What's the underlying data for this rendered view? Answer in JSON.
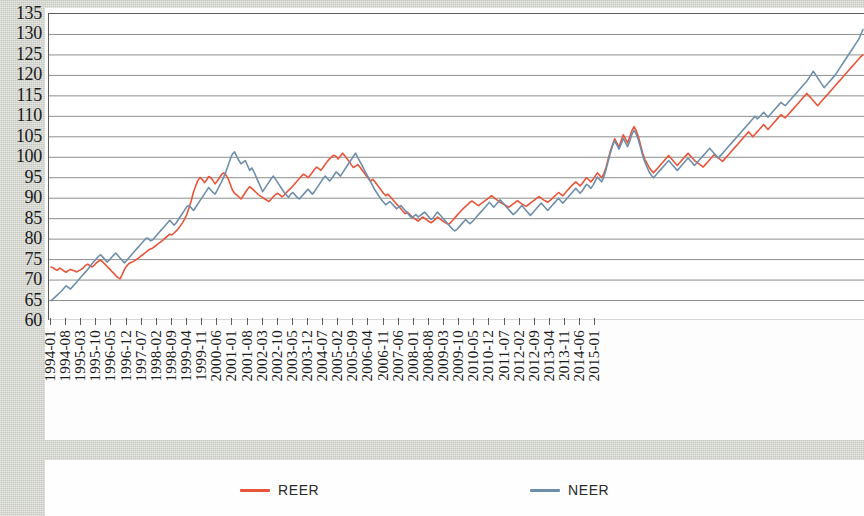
{
  "chart_data": {
    "type": "line",
    "title": "",
    "xlabel": "",
    "ylabel": "",
    "ylim": [
      60,
      135
    ],
    "ytick_step": 5,
    "yticks": [
      135,
      130,
      125,
      120,
      115,
      110,
      105,
      100,
      95,
      90,
      85,
      80,
      75,
      70,
      65,
      60
    ],
    "grid": true,
    "legend_position": "bottom",
    "x_tick_interval_months": 7,
    "x_start": "1994-01",
    "x_end": "2015-01",
    "tick_labels": [
      "1994-01",
      "1994-08",
      "1995-03",
      "1995-10",
      "1996-05",
      "1996-12",
      "1997-07",
      "1998-02",
      "1998-09",
      "1999-04",
      "1999-11",
      "2000-06",
      "2001-01",
      "2001-08",
      "2002-03",
      "2002-10",
      "2003-05",
      "2003-12",
      "2004-07",
      "2005-02",
      "2005-09",
      "2006-04",
      "2006-11",
      "2007-06",
      "2008-01",
      "2008-08",
      "2009-03",
      "2009-10",
      "2010-05",
      "2010-12",
      "2011-07",
      "2012-02",
      "2012-09",
      "2013-04",
      "2013-11",
      "2014-06",
      "2015-01"
    ],
    "colors": {
      "REER": "#e8553a",
      "NEER": "#6e8fab"
    },
    "series": [
      {
        "name": "REER",
        "color": "#e8553a",
        "values": [
          73.2,
          73.0,
          72.6,
          72.4,
          72.9,
          72.6,
          72.2,
          71.9,
          72.3,
          72.6,
          72.4,
          72.2,
          72.0,
          72.3,
          72.6,
          73.0,
          73.6,
          73.9,
          73.5,
          73.2,
          73.6,
          74.2,
          74.6,
          74.9,
          74.4,
          73.9,
          73.3,
          72.8,
          72.2,
          71.7,
          71.1,
          70.6,
          70.3,
          71.4,
          72.6,
          73.4,
          74.0,
          74.3,
          74.5,
          74.8,
          75.2,
          75.6,
          76.0,
          76.4,
          76.8,
          77.3,
          77.6,
          77.8,
          78.2,
          78.6,
          79.0,
          79.4,
          79.8,
          80.3,
          80.8,
          81.2,
          81.0,
          81.5,
          82.0,
          82.6,
          83.3,
          84.1,
          85.0,
          86.2,
          87.8,
          89.5,
          91.5,
          93.0,
          94.3,
          95.1,
          94.6,
          93.8,
          94.4,
          95.3,
          95.0,
          94.3,
          93.5,
          94.2,
          95.0,
          95.8,
          96.2,
          95.7,
          94.8,
          93.4,
          92.0,
          91.2,
          90.8,
          90.3,
          89.8,
          90.6,
          91.4,
          92.2,
          92.8,
          92.4,
          91.9,
          91.4,
          90.9,
          90.5,
          90.2,
          89.8,
          89.5,
          89.2,
          89.8,
          90.4,
          90.9,
          91.2,
          90.8,
          90.3,
          90.8,
          91.4,
          91.9,
          92.4,
          93.0,
          93.6,
          94.2,
          94.8,
          95.4,
          95.9,
          95.5,
          95.0,
          95.6,
          96.3,
          97.0,
          97.6,
          97.2,
          96.8,
          97.5,
          98.3,
          99.0,
          99.6,
          100.1,
          100.5,
          100.2,
          99.6,
          100.3,
          101.0,
          100.4,
          99.7,
          99.0,
          98.2,
          97.5,
          97.8,
          98.2,
          97.6,
          96.9,
          96.2,
          95.5,
          94.8,
          94.2,
          94.6,
          94.0,
          93.3,
          92.6,
          91.9,
          91.2,
          90.6,
          91.0,
          90.4,
          89.8,
          89.2,
          88.6,
          88.0,
          87.4,
          86.8,
          86.2,
          86.6,
          86.1,
          85.6,
          85.1,
          84.8,
          84.4,
          84.9,
          85.4,
          85.1,
          84.7,
          84.3,
          84.0,
          84.4,
          84.9,
          85.4,
          85.0,
          84.6,
          84.2,
          83.9,
          83.6,
          84.0,
          84.6,
          85.2,
          85.8,
          86.4,
          87.0,
          87.5,
          88.0,
          88.5,
          89.0,
          89.3,
          88.9,
          88.5,
          88.2,
          88.6,
          89.0,
          89.4,
          89.8,
          90.2,
          90.6,
          90.2,
          89.8,
          89.4,
          89.0,
          88.7,
          88.4,
          88.1,
          87.8,
          88.2,
          88.6,
          89.0,
          89.4,
          89.0,
          88.6,
          88.3,
          88.0,
          88.4,
          88.8,
          89.2,
          89.6,
          90.0,
          90.4,
          90.0,
          89.6,
          89.3,
          89.0,
          89.4,
          89.9,
          90.4,
          90.9,
          91.4,
          91.0,
          90.6,
          91.2,
          91.8,
          92.4,
          93.0,
          93.5,
          94.0,
          93.5,
          93.0,
          93.6,
          94.3,
          95.0,
          94.5,
          94.0,
          94.6,
          95.4,
          96.2,
          95.6,
          95.0,
          96.0,
          97.5,
          99.5,
          101.5,
          103.0,
          104.5,
          103.5,
          102.5,
          104.0,
          105.5,
          104.5,
          103.5,
          105.0,
          106.5,
          107.5,
          106.5,
          105.0,
          103.0,
          101.0,
          99.5,
          98.5,
          97.5,
          96.8,
          96.2,
          96.8,
          97.4,
          98.0,
          98.6,
          99.2,
          99.8,
          100.4,
          99.8,
          99.2,
          98.6,
          98.0,
          98.6,
          99.2,
          99.8,
          100.4,
          101.0,
          100.4,
          99.8,
          99.2,
          98.8,
          98.4,
          98.0,
          97.6,
          98.2,
          98.8,
          99.4,
          100.0,
          100.6,
          100.2,
          99.8,
          99.4,
          99.0,
          99.6,
          100.2,
          100.8,
          101.4,
          102.0,
          102.6,
          103.2,
          103.8,
          104.4,
          105.0,
          105.6,
          106.2,
          105.6,
          105.0,
          105.6,
          106.2,
          106.8,
          107.4,
          108.0,
          107.4,
          106.8,
          107.4,
          108.0,
          108.6,
          109.2,
          109.8,
          110.4,
          110.0,
          109.6,
          110.2,
          110.8,
          111.4,
          112.0,
          112.6,
          113.2,
          113.8,
          114.4,
          115.0,
          115.6,
          115.0,
          114.4,
          113.8,
          113.2,
          112.6,
          113.2,
          113.8,
          114.4,
          115.0,
          115.6,
          116.2,
          116.8,
          117.4,
          118.0,
          118.6,
          119.2,
          119.8,
          120.4,
          121.0,
          121.6,
          122.2,
          122.8,
          123.4,
          124.0,
          124.6,
          125.0
        ]
      },
      {
        "name": "NEER",
        "color": "#6e8fab",
        "values": [
          65.0,
          65.4,
          65.9,
          66.4,
          66.9,
          67.4,
          68.0,
          68.6,
          68.2,
          67.8,
          68.4,
          69.0,
          69.6,
          70.2,
          70.8,
          71.4,
          72.0,
          72.6,
          73.3,
          74.0,
          74.6,
          75.2,
          75.8,
          76.2,
          75.6,
          75.0,
          74.4,
          74.9,
          75.5,
          76.1,
          76.6,
          76.0,
          75.4,
          74.8,
          74.2,
          74.8,
          75.4,
          76.0,
          76.6,
          77.2,
          77.8,
          78.4,
          79.0,
          79.6,
          80.2,
          80.2,
          79.6,
          79.8,
          80.4,
          81.0,
          81.6,
          82.2,
          82.8,
          83.4,
          84.0,
          84.6,
          84.0,
          83.4,
          84.0,
          84.8,
          85.6,
          86.4,
          87.2,
          88.0,
          88.2,
          87.6,
          87.0,
          87.8,
          88.6,
          89.4,
          90.2,
          91.0,
          91.8,
          92.6,
          92.0,
          91.4,
          91.0,
          92.0,
          93.0,
          94.0,
          95.2,
          96.5,
          98.0,
          99.5,
          100.8,
          101.3,
          100.2,
          99.2,
          98.4,
          98.8,
          99.2,
          98.0,
          96.8,
          97.4,
          96.4,
          95.2,
          94.0,
          92.8,
          91.6,
          92.4,
          93.2,
          94.0,
          94.8,
          95.4,
          94.6,
          93.8,
          93.0,
          92.2,
          91.4,
          90.8,
          90.2,
          91.0,
          91.4,
          90.8,
          90.2,
          89.8,
          90.4,
          91.0,
          91.6,
          92.2,
          91.6,
          91.0,
          91.6,
          92.4,
          93.2,
          94.0,
          94.8,
          95.4,
          94.8,
          94.2,
          94.8,
          95.6,
          96.4,
          96.0,
          95.4,
          96.2,
          97.0,
          97.8,
          98.6,
          99.4,
          100.2,
          101.0,
          100.0,
          99.0,
          98.0,
          97.0,
          96.0,
          95.0,
          94.0,
          93.0,
          92.0,
          91.2,
          90.4,
          89.6,
          89.0,
          88.4,
          88.8,
          89.2,
          88.6,
          88.0,
          87.4,
          87.8,
          88.2,
          87.6,
          87.0,
          86.4,
          85.8,
          85.2,
          85.6,
          86.0,
          85.4,
          85.8,
          86.2,
          86.6,
          86.0,
          85.4,
          84.8,
          85.2,
          86.0,
          86.6,
          86.0,
          85.4,
          84.8,
          84.2,
          83.6,
          83.0,
          82.4,
          82.0,
          82.4,
          83.0,
          83.6,
          84.2,
          84.8,
          84.2,
          83.8,
          84.2,
          84.8,
          85.4,
          86.0,
          86.6,
          87.2,
          87.8,
          88.4,
          89.0,
          88.4,
          87.8,
          88.4,
          89.0,
          89.6,
          89.0,
          88.4,
          87.8,
          87.2,
          86.6,
          86.0,
          86.4,
          87.0,
          87.6,
          88.2,
          87.6,
          87.0,
          86.4,
          85.8,
          86.4,
          87.0,
          87.6,
          88.2,
          88.8,
          88.2,
          87.6,
          87.0,
          87.6,
          88.2,
          88.8,
          89.4,
          90.0,
          89.4,
          88.8,
          89.4,
          90.0,
          90.6,
          91.2,
          91.8,
          92.4,
          91.8,
          91.2,
          91.8,
          92.6,
          93.4,
          93.0,
          92.4,
          93.2,
          94.2,
          95.2,
          94.6,
          94.0,
          95.2,
          97.0,
          99.0,
          101.0,
          102.8,
          104.0,
          103.0,
          102.0,
          103.2,
          104.6,
          103.6,
          102.6,
          104.0,
          105.6,
          106.6,
          105.6,
          104.2,
          102.4,
          100.4,
          98.8,
          97.6,
          96.4,
          95.6,
          95.0,
          95.6,
          96.2,
          96.8,
          97.4,
          98.0,
          98.6,
          99.2,
          98.6,
          98.0,
          97.4,
          96.8,
          97.4,
          98.0,
          98.6,
          99.2,
          99.8,
          99.2,
          98.6,
          98.0,
          98.6,
          99.2,
          99.8,
          100.4,
          101.0,
          101.6,
          102.2,
          101.6,
          101.0,
          100.4,
          99.8,
          100.4,
          101.0,
          101.6,
          102.2,
          102.8,
          103.4,
          104.0,
          104.6,
          105.2,
          105.8,
          106.4,
          107.0,
          107.6,
          108.2,
          108.8,
          109.4,
          110.0,
          109.4,
          109.8,
          110.4,
          111.0,
          110.4,
          109.8,
          110.4,
          111.0,
          111.6,
          112.2,
          112.8,
          113.4,
          113.0,
          112.6,
          113.2,
          113.8,
          114.4,
          115.0,
          115.6,
          116.2,
          116.8,
          117.4,
          118.0,
          118.6,
          119.4,
          120.2,
          121.0,
          120.2,
          119.4,
          118.6,
          117.8,
          117.0,
          117.6,
          118.2,
          118.8,
          119.4,
          120.0,
          120.8,
          121.6,
          122.4,
          123.2,
          124.0,
          124.8,
          125.6,
          126.4,
          127.2,
          128.0,
          128.8,
          130.0,
          131.2
        ]
      }
    ]
  },
  "legend": {
    "items": [
      {
        "label": "REER",
        "color": "#e8553a"
      },
      {
        "label": "NEER",
        "color": "#6e8fab"
      }
    ]
  }
}
